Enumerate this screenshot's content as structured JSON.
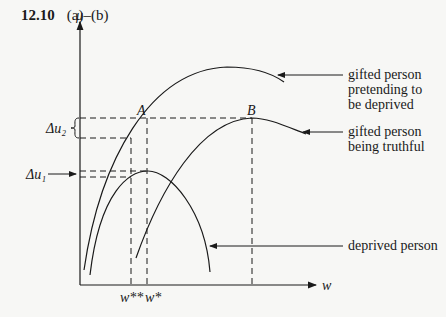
{
  "header": {
    "number": "12.10",
    "parts": "(a)–(b)"
  },
  "axes": {
    "y_label": "μ",
    "x_label": "w"
  },
  "points": {
    "a": "A",
    "b": "B"
  },
  "ticks": {
    "w_double_star": "w**",
    "w_star": "w*"
  },
  "deltas": {
    "du2": "Δu₂",
    "du1": "Δu₁"
  },
  "legend": {
    "pretending": [
      "gifted person",
      "pretending to",
      "be deprived"
    ],
    "truthful": [
      "gifted person",
      "being truthful"
    ],
    "deprived": [
      "deprived person"
    ]
  }
}
